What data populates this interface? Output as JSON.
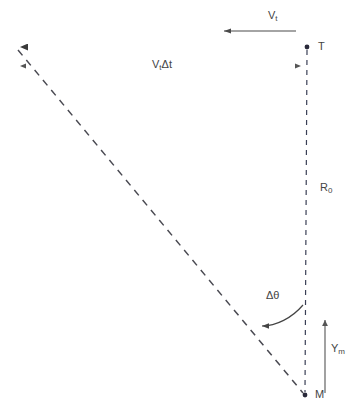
{
  "figure": {
    "background_color": "#ffffff",
    "width": 363,
    "height": 414
  },
  "labels": {
    "velocity": {
      "base": "V",
      "sub": "t",
      "x": 268,
      "y": 10
    },
    "displacement": {
      "base": "V",
      "sub": "t",
      "tail": "Δt",
      "x": 152,
      "y": 59
    },
    "target_point": {
      "text": "T",
      "x": 318,
      "y": 41
    },
    "range": {
      "base": "R",
      "sub": "0",
      "x": 320,
      "y": 182
    },
    "delta_theta": {
      "text": "Δθ",
      "x": 266,
      "y": 290
    },
    "y_missile": {
      "base": "Y",
      "sub": "m",
      "x": 331,
      "y": 343
    },
    "missile_point": {
      "text": "M",
      "x": 315,
      "y": 389
    }
  },
  "geometry": {
    "point_T": {
      "x": 307,
      "y": 47
    },
    "point_M": {
      "x": 305,
      "y": 395
    },
    "point_L": {
      "x": 14,
      "y": 47
    },
    "los_line": {
      "x1": 307,
      "y1": 47,
      "x2": 14,
      "y2": 47
    },
    "dimension_line": {
      "x1": 14,
      "y1": 66,
      "x2": 307,
      "y2": 66
    },
    "velocity_arrow": {
      "x1": 296,
      "y1": 31,
      "x2": 222,
      "y2": 31
    },
    "vertical_dashed": {
      "x1": 307,
      "y1": 47,
      "x2": 305,
      "y2": 395
    },
    "diagonal_dashed": {
      "x1": 18,
      "y1": 49,
      "x2": 304,
      "y2": 394
    },
    "ym_arrow": {
      "x1": 325,
      "y1": 393,
      "x2": 325,
      "y2": 317
    },
    "theta_arc": {
      "start_x": 303,
      "start_y": 305,
      "end_x": 257,
      "end_y": 326
    }
  },
  "colors": {
    "line_dark": "#3a3a3a",
    "line_mid": "#555555",
    "dash_navy": "#3a3f55",
    "label_text": "#444444",
    "tint_red": "#b04a4a",
    "tint_green": "#4a9a6a",
    "tint_blue": "#3a4a8a"
  }
}
